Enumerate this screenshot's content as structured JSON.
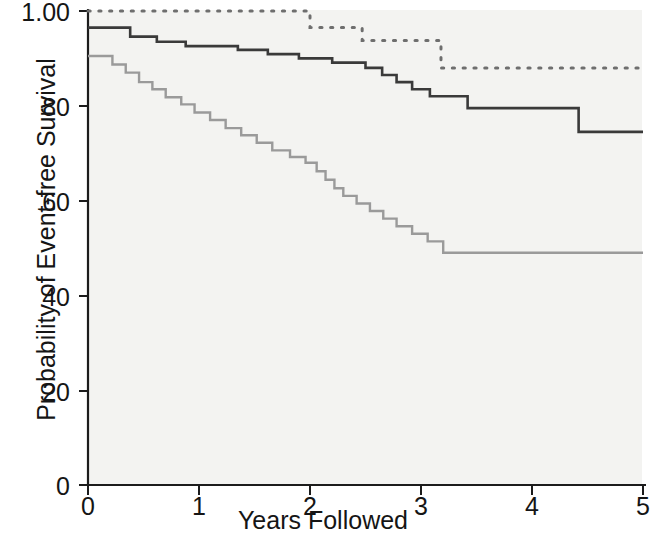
{
  "chart_data": {
    "type": "line",
    "title": "",
    "subtitle": "",
    "xlabel": "Years Followed",
    "ylabel": "Probability of Event-free Survival",
    "xlim": [
      0,
      5
    ],
    "ylim": [
      0,
      100
    ],
    "grid": false,
    "legend_position": "none",
    "x_ticks": [
      0,
      1,
      2,
      3,
      4,
      5
    ],
    "x_tick_labels": [
      "0",
      "1",
      "2",
      "3",
      "4",
      "5"
    ],
    "y_ticks": [
      0,
      20,
      40,
      60,
      80,
      100
    ],
    "y_tick_labels": [
      "0",
      "20",
      "40",
      "60",
      "80",
      "1.00"
    ],
    "annotations": [],
    "series": [
      {
        "name": "dotted-upper-curve",
        "style": "dotted",
        "color": "#6e6e6e",
        "start_value": 100,
        "end_value": 88,
        "steps": [
          [
            0.0,
            100
          ],
          [
            2.0,
            100
          ],
          [
            2.0,
            96.5
          ],
          [
            2.47,
            96.5
          ],
          [
            2.47,
            93.8
          ],
          [
            3.18,
            93.8
          ],
          [
            3.18,
            88.0
          ],
          [
            5.0,
            88.0
          ]
        ]
      },
      {
        "name": "solid-dark-middle-curve",
        "style": "solid",
        "color": "#3a3a3a",
        "start_value": 96.5,
        "end_value": 74.5,
        "steps": [
          [
            0.0,
            96.5
          ],
          [
            0.38,
            96.5
          ],
          [
            0.38,
            94.6
          ],
          [
            0.62,
            94.6
          ],
          [
            0.62,
            93.5
          ],
          [
            0.88,
            93.5
          ],
          [
            0.88,
            92.6
          ],
          [
            1.35,
            92.6
          ],
          [
            1.35,
            91.8
          ],
          [
            1.62,
            91.8
          ],
          [
            1.62,
            90.9
          ],
          [
            1.9,
            90.9
          ],
          [
            1.9,
            90.0
          ],
          [
            2.2,
            90.0
          ],
          [
            2.2,
            89.1
          ],
          [
            2.5,
            89.1
          ],
          [
            2.5,
            88.0
          ],
          [
            2.65,
            88.0
          ],
          [
            2.65,
            86.5
          ],
          [
            2.78,
            86.5
          ],
          [
            2.78,
            85.0
          ],
          [
            2.92,
            85.0
          ],
          [
            2.92,
            83.5
          ],
          [
            3.08,
            83.5
          ],
          [
            3.08,
            82.0
          ],
          [
            3.42,
            82.0
          ],
          [
            3.42,
            79.5
          ],
          [
            4.42,
            79.5
          ],
          [
            4.42,
            74.5
          ],
          [
            5.0,
            74.5
          ]
        ]
      },
      {
        "name": "solid-light-gray-lower-curve",
        "style": "solid",
        "color": "#9a9a9a",
        "start_value": 90.5,
        "end_value": 49.0,
        "steps": [
          [
            0.0,
            90.5
          ],
          [
            0.22,
            90.5
          ],
          [
            0.22,
            88.7
          ],
          [
            0.34,
            88.7
          ],
          [
            0.34,
            87.0
          ],
          [
            0.46,
            87.0
          ],
          [
            0.46,
            85.0
          ],
          [
            0.58,
            85.0
          ],
          [
            0.58,
            83.5
          ],
          [
            0.7,
            83.5
          ],
          [
            0.7,
            81.8
          ],
          [
            0.84,
            81.8
          ],
          [
            0.84,
            80.3
          ],
          [
            0.96,
            80.3
          ],
          [
            0.96,
            78.6
          ],
          [
            1.1,
            78.6
          ],
          [
            1.1,
            77.0
          ],
          [
            1.24,
            77.0
          ],
          [
            1.24,
            75.3
          ],
          [
            1.38,
            75.3
          ],
          [
            1.38,
            73.8
          ],
          [
            1.52,
            73.8
          ],
          [
            1.52,
            72.2
          ],
          [
            1.66,
            72.2
          ],
          [
            1.66,
            70.6
          ],
          [
            1.82,
            70.6
          ],
          [
            1.82,
            69.2
          ],
          [
            1.96,
            69.2
          ],
          [
            1.96,
            68.0
          ],
          [
            2.06,
            68.0
          ],
          [
            2.06,
            66.2
          ],
          [
            2.14,
            66.2
          ],
          [
            2.14,
            64.4
          ],
          [
            2.22,
            64.4
          ],
          [
            2.22,
            62.6
          ],
          [
            2.3,
            62.6
          ],
          [
            2.3,
            61.0
          ],
          [
            2.42,
            61.0
          ],
          [
            2.42,
            59.4
          ],
          [
            2.54,
            59.4
          ],
          [
            2.54,
            57.8
          ],
          [
            2.66,
            57.8
          ],
          [
            2.66,
            56.2
          ],
          [
            2.78,
            56.2
          ],
          [
            2.78,
            54.6
          ],
          [
            2.92,
            54.6
          ],
          [
            2.92,
            53.0
          ],
          [
            3.06,
            53.0
          ],
          [
            3.06,
            51.4
          ],
          [
            3.2,
            51.4
          ],
          [
            3.2,
            49.0
          ],
          [
            5.0,
            49.0
          ]
        ]
      }
    ]
  },
  "axes": {
    "y_title": "Probability of Event-free Survival",
    "x_title": "Years Followed",
    "y_labels": [
      "1.00",
      "80",
      "60",
      "40",
      "20",
      "0"
    ],
    "x_labels": [
      "0",
      "1",
      "2",
      "3",
      "4",
      "5"
    ]
  },
  "colors": {
    "dark_curve": "#3a3a3a",
    "light_curve": "#9a9a9a",
    "dotted_curve": "#6e6e6e",
    "axis": "#1c1c1c",
    "plot_background": "#f3f3f1",
    "page_background": "#ffffff"
  }
}
